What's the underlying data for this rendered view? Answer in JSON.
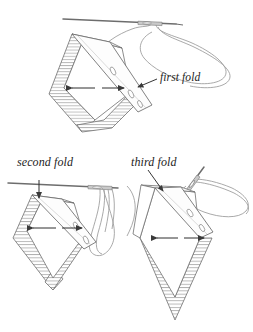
{
  "figure": {
    "background_color": "#ffffff",
    "line_color": "#5a5a5a",
    "hatch_color": "#b9b9b9",
    "thread_color": "#8e8e8e",
    "label_color": "#1d1d1d",
    "cropped_caption_top": ""
  },
  "labels": {
    "first_fold": "first fold",
    "second_fold": "second fold",
    "third_fold": "third fold"
  },
  "steps": [
    {
      "id": "step-1",
      "label": "first fold",
      "position": "top",
      "description": "Diamond shaped folded fabric with hatched left and lower edges, a diagonal binding band across the right face, needle entering from upper right with a long looping thread."
    },
    {
      "id": "step-2",
      "label": "second fold",
      "position": "bottom-left",
      "description": "Diamond shaped folded fabric with hatched outer band, vertical down arrow at top, needle laid horizontally across the top with thread looping down the right side."
    },
    {
      "id": "step-3",
      "label": "third fold",
      "position": "bottom-right",
      "description": "Diamond shaped folded fabric with hatched lower triangle, needle angled into the upper fold with thread forming a large loop to the right."
    }
  ],
  "annotations": {
    "dimension_arrow": "double-headed-horizontal-arrow",
    "down_arrow": "downward-arrow",
    "leader_line": "leader-line-to-label"
  }
}
